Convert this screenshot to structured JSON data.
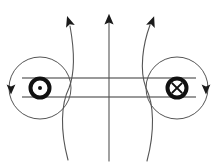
{
  "figure": {
    "kind": "physics-field-line-diagram",
    "title": "Magnetic field lines of two antiparallel current-carrying wires",
    "width": 217,
    "height": 164,
    "background_color": "#ffffff",
    "colors": {
      "wire_ring": "#111111",
      "field_line_circle": "#555555",
      "field_line_curve": "#555555",
      "connector_line": "#777777",
      "arrowhead": "#1a1a1a"
    },
    "stroke_widths": {
      "wire_ring": 4.0,
      "field_line_circle": 1.0,
      "field_line_curve": 1.1,
      "connector_line": 1.4
    }
  },
  "wires": [
    {
      "id": "left-wire",
      "symbol_name": "current-out-of-page-dot",
      "symbol_glyph": "⊙",
      "meaning": "current out of page",
      "center_x": 40,
      "center_y": 88,
      "ring_radius": 9.5,
      "dot_radius": 2.0
    },
    {
      "id": "right-wire",
      "symbol_name": "current-into-page-cross",
      "symbol_glyph": "⊗",
      "meaning": "current into page",
      "center_x": 177,
      "center_y": 88,
      "ring_radius": 9.5,
      "cross_arm": 6.6
    }
  ],
  "circular_field_lines": [
    {
      "id": "left-field-circle",
      "center_x": 40,
      "center_y": 88,
      "radius": 31,
      "direction": "clockwise",
      "arrow_name": "left-circle-arrowhead",
      "arrow_x": 11,
      "arrow_y": 88,
      "arrow_points": "down"
    },
    {
      "id": "right-field-circle",
      "center_x": 177,
      "center_y": 88,
      "radius": 31,
      "direction": "counterclockwise",
      "arrow_name": "right-circle-arrowhead",
      "arrow_x": 206,
      "arrow_y": 88,
      "arrow_points": "down"
    }
  ],
  "vertical_field_lines": [
    {
      "id": "left-curve",
      "path": "M 68 160 C 60 130 61 104 69 88 C 76 70 74 48 70 26",
      "bulge": "bows left at mid-height",
      "arrow_name": "left-curve-arrowhead",
      "arrow_x": 69,
      "arrow_y": 19,
      "arrow_angle_deg": -18,
      "arrow_points": "up-left"
    },
    {
      "id": "center-line",
      "path": "M 109 161 L 109 22",
      "bulge": "straight vertical",
      "arrow_name": "center-line-arrowhead",
      "arrow_x": 109,
      "arrow_y": 17,
      "arrow_angle_deg": 0,
      "arrow_points": "up"
    },
    {
      "id": "right-curve",
      "path": "M 147 161 C 155 131 154 104 146 88 C 139 70 143 44 150 25",
      "bulge": "bows right at mid-height",
      "arrow_name": "right-curve-arrowhead",
      "arrow_x": 152,
      "arrow_y": 19,
      "arrow_angle_deg": 20,
      "arrow_points": "up-right"
    }
  ],
  "connector_lines": [
    {
      "id": "upper-connector",
      "x1": 22,
      "y1": 78,
      "x2": 196,
      "y2": 78,
      "orientation": "horizontal"
    },
    {
      "id": "lower-connector",
      "x1": 22,
      "y1": 97,
      "x2": 196,
      "y2": 97,
      "orientation": "horizontal"
    }
  ],
  "labels": {
    "text_items": []
  }
}
